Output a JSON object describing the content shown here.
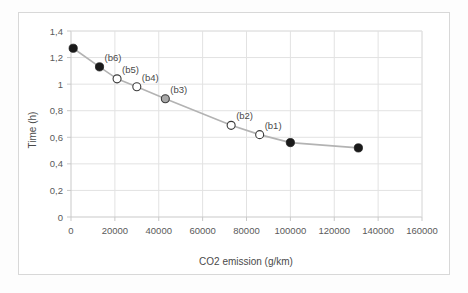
{
  "chart_data": {
    "type": "line",
    "title": "",
    "xlabel": "CO2 emission (g/km)",
    "ylabel": "Time (h)",
    "xlim": [
      0,
      160000
    ],
    "ylim": [
      0,
      1.4
    ],
    "xticks": [
      0,
      20000,
      40000,
      60000,
      80000,
      100000,
      120000,
      140000,
      160000
    ],
    "xtick_labels": [
      "0",
      "20000",
      "40000",
      "60000",
      "80000",
      "100000",
      "120000",
      "140000",
      "160000"
    ],
    "yticks": [
      0,
      0.2,
      0.4,
      0.6,
      0.8,
      1.0,
      1.2,
      1.4
    ],
    "ytick_labels": [
      "0",
      "0,2",
      "0,4",
      "0,6",
      "0,8",
      "1",
      "1,2",
      "1,4"
    ],
    "grid": true,
    "legend": "none",
    "decimal_separator": ",",
    "series": [
      {
        "name": "Pareto front",
        "line_color": "#b3b3b3",
        "x": [
          1000,
          13000,
          21000,
          30000,
          43000,
          73000,
          86000,
          100000,
          131000
        ],
        "y": [
          1.27,
          1.13,
          1.04,
          0.98,
          0.89,
          0.69,
          0.62,
          0.56,
          0.52
        ],
        "marker_styles": [
          "filled",
          "filled",
          "open",
          "open",
          "gray",
          "open",
          "open",
          "filled",
          "filled"
        ],
        "annotations": [
          "",
          "(b6)",
          "(b5)",
          "(b4)",
          "(b3)",
          "(b2)",
          "(b1)",
          "",
          ""
        ]
      }
    ]
  }
}
